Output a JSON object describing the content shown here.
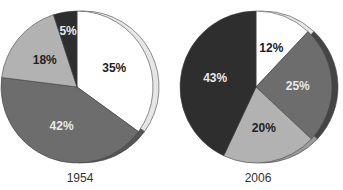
{
  "chart_data": [
    {
      "type": "pie",
      "title": "1954",
      "start_angle_deg": 0,
      "direction": "clockwise",
      "slices": [
        {
          "label": "35%",
          "value": 35,
          "color": "#ffffff",
          "rim_color": "#e6e6e6",
          "text_color": "#222222"
        },
        {
          "label": "42%",
          "value": 42,
          "color": "#6d6d6d",
          "rim_color": "#555555",
          "text_color": "#e8e8e8"
        },
        {
          "label": "18%",
          "value": 18,
          "color": "#b2b2b2",
          "rim_color": "#999999",
          "text_color": "#222222"
        },
        {
          "label": "5%",
          "value": 5,
          "color": "#2e2e2e",
          "rim_color": "#111111",
          "text_color": "#e8e8e8"
        }
      ]
    },
    {
      "type": "pie",
      "title": "2006",
      "start_angle_deg": 0,
      "direction": "clockwise",
      "slices": [
        {
          "label": "12%",
          "value": 12,
          "color": "#ffffff",
          "rim_color": "#e6e6e6",
          "text_color": "#222222"
        },
        {
          "label": "25%",
          "value": 25,
          "color": "#6d6d6d",
          "rim_color": "#444444",
          "text_color": "#e8e8e8"
        },
        {
          "label": "20%",
          "value": 20,
          "color": "#b2b2b2",
          "rim_color": "#999999",
          "text_color": "#222222"
        },
        {
          "label": "43%",
          "value": 43,
          "color": "#2e2e2e",
          "rim_color": "#111111",
          "text_color": "#e8e8e8"
        }
      ]
    }
  ],
  "captions": {
    "left": "1954",
    "right": "2006"
  }
}
